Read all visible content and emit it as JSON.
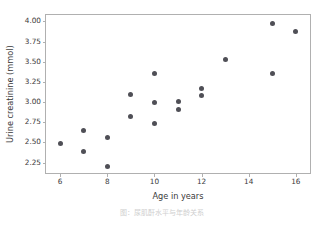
{
  "chart_data": {
    "type": "scatter",
    "title": "",
    "xlabel": "Age in years",
    "ylabel": "Urine creatinine (mmol)",
    "xlim": [
      5.4,
      16.6
    ],
    "ylim": [
      2.12,
      4.08
    ],
    "xticks": [
      6,
      8,
      10,
      12,
      14,
      16
    ],
    "xtick_labels": [
      "6",
      "8",
      "10",
      "12",
      "14",
      "16"
    ],
    "yticks": [
      2.25,
      2.5,
      2.75,
      3.0,
      3.25,
      3.5,
      3.75,
      4.0
    ],
    "ytick_labels": [
      "2.25",
      "2.50",
      "2.75",
      "3.00",
      "3.25",
      "3.50",
      "3.75",
      "4.00"
    ],
    "grid": false,
    "legend": null,
    "marker_color": "#4f4f56",
    "x": [
      6,
      7,
      7,
      8,
      8,
      9,
      9,
      10,
      10,
      10,
      11,
      11,
      12,
      12,
      13,
      15,
      15,
      16
    ],
    "y": [
      2.49,
      2.65,
      2.39,
      2.56,
      2.2,
      3.09,
      2.82,
      3.36,
      3.0,
      2.73,
      3.01,
      2.91,
      3.17,
      3.08,
      3.53,
      3.97,
      3.35,
      3.88
    ],
    "points": [
      {
        "x": 6,
        "y": 2.49
      },
      {
        "x": 7,
        "y": 2.65
      },
      {
        "x": 7,
        "y": 2.39
      },
      {
        "x": 8,
        "y": 2.56
      },
      {
        "x": 8,
        "y": 2.2
      },
      {
        "x": 9,
        "y": 3.09
      },
      {
        "x": 9,
        "y": 2.82
      },
      {
        "x": 10,
        "y": 3.36
      },
      {
        "x": 10,
        "y": 3.0
      },
      {
        "x": 10,
        "y": 2.73
      },
      {
        "x": 11,
        "y": 3.01
      },
      {
        "x": 11,
        "y": 2.91
      },
      {
        "x": 12,
        "y": 3.17
      },
      {
        "x": 12,
        "y": 3.08
      },
      {
        "x": 13,
        "y": 3.53
      },
      {
        "x": 15,
        "y": 3.97
      },
      {
        "x": 15,
        "y": 3.35
      },
      {
        "x": 16,
        "y": 3.88
      }
    ]
  },
  "caption": {
    "text": "图：尿肌酐水平与年龄关系"
  }
}
